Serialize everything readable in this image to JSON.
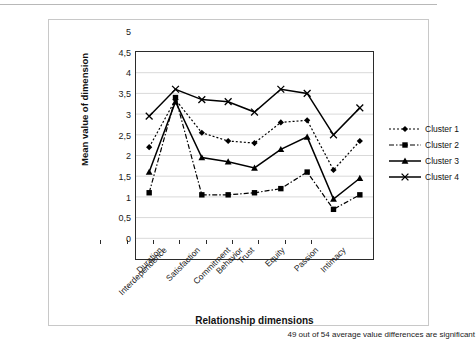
{
  "chart_data": {
    "type": "line",
    "title": "",
    "xlabel": "Relationship dimensions",
    "ylabel": "Mean value of dimension",
    "ylim": [
      0,
      5
    ],
    "ytick_step": 0.5,
    "decimal_separator": ",",
    "grid": true,
    "legend_position": "right",
    "ytick_labels": [
      "5",
      "4,5",
      "4",
      "3,5",
      "3",
      "2,5",
      "2",
      "1,5",
      "1",
      "0,5",
      "0"
    ],
    "categories": [
      "Interdependence",
      "Duration",
      "Satisfaction",
      "Commitment",
      "Behavior",
      "Trust",
      "Equity",
      "Passion",
      "Intimacy"
    ],
    "series": [
      {
        "name": "Cluster 1",
        "marker": "diamond",
        "line_style": "dotted",
        "color": "#000000",
        "values": [
          2.7,
          3.85,
          3.05,
          2.85,
          2.8,
          3.3,
          3.35,
          2.15,
          2.85
        ]
      },
      {
        "name": "Cluster 2",
        "marker": "square",
        "line_style": "dash-dot",
        "color": "#000000",
        "values": [
          1.6,
          3.9,
          1.55,
          1.55,
          1.6,
          1.7,
          2.1,
          1.2,
          1.55
        ]
      },
      {
        "name": "Cluster 3",
        "marker": "triangle",
        "line_style": "solid",
        "color": "#000000",
        "values": [
          2.1,
          3.8,
          2.45,
          2.35,
          2.2,
          2.65,
          2.95,
          1.45,
          1.95
        ]
      },
      {
        "name": "Cluster 4",
        "marker": "cross",
        "line_style": "solid",
        "color": "#000000",
        "values": [
          3.45,
          4.1,
          3.85,
          3.8,
          3.55,
          4.1,
          4.0,
          3.0,
          3.65
        ]
      }
    ],
    "annotation": "49 out of 54 average value differences are significant"
  }
}
